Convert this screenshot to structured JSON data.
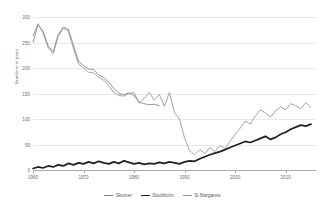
{
  "chart_data": {
    "type": "line",
    "title": "",
    "xlabel": "",
    "ylabel": "Numbers of pairs",
    "xlim": [
      1960,
      2016
    ],
    "ylim": [
      0,
      300
    ],
    "yticks": [
      0,
      50,
      100,
      150,
      200,
      250,
      300
    ],
    "xticks": [
      1960,
      1970,
      1980,
      1990,
      2000,
      2010
    ],
    "grid": "horizontal",
    "legend_position": "bottom",
    "colors": {
      "skomer": "#808285",
      "stockholm": "#231f20",
      "st_margarets": "#939598",
      "gridline": "#e9e9ec",
      "axis": "#a7a9ac",
      "text": "#6d6e71"
    },
    "series": [
      {
        "name": "Skomer",
        "color": "#808285",
        "x": [
          1960,
          1961,
          1962,
          1963,
          1964,
          1965,
          1966,
          1967,
          1968,
          1969,
          1970,
          1971,
          1972,
          1973,
          1974,
          1975,
          1976,
          1977,
          1978,
          1979,
          1980,
          1981,
          1982,
          1983,
          1984,
          1985
        ],
        "values": [
          251,
          285,
          272,
          243,
          232,
          266,
          280,
          276,
          245,
          213,
          205,
          198,
          197,
          186,
          181,
          172,
          160,
          150,
          148,
          151,
          146,
          133,
          130,
          128,
          129,
          126
        ]
      },
      {
        "name": "Stockholm",
        "color": "#231f20",
        "x": [
          1960,
          1961,
          1962,
          1963,
          1964,
          1965,
          1966,
          1967,
          1968,
          1969,
          1970,
          1971,
          1972,
          1973,
          1974,
          1975,
          1976,
          1977,
          1978,
          1979,
          1980,
          1981,
          1982,
          1983,
          1984,
          1985,
          1986,
          1987,
          1988,
          1989,
          1990,
          1991,
          1992,
          1993,
          1994,
          1995,
          1996,
          1997,
          1998,
          1999,
          2000,
          2001,
          2002,
          2003,
          2004,
          2005,
          2006,
          2007,
          2008,
          2009,
          2010,
          2011,
          2012,
          2013,
          2014,
          2015
        ],
        "values": [
          3,
          6,
          4,
          8,
          6,
          10,
          8,
          13,
          10,
          14,
          12,
          16,
          13,
          17,
          14,
          12,
          16,
          13,
          18,
          15,
          12,
          14,
          11,
          13,
          12,
          15,
          13,
          16,
          14,
          12,
          16,
          18,
          17,
          22,
          26,
          30,
          33,
          36,
          40,
          44,
          48,
          52,
          56,
          54,
          58,
          62,
          66,
          60,
          64,
          70,
          74,
          80,
          84,
          88,
          86,
          90
        ]
      },
      {
        "name": "St Margarets",
        "color": "#939598",
        "x": [
          1960,
          1961,
          1962,
          1963,
          1964,
          1965,
          1966,
          1967,
          1968,
          1969,
          1970,
          1971,
          1972,
          1973,
          1974,
          1975,
          1976,
          1977,
          1978,
          1979,
          1980,
          1981,
          1982,
          1983,
          1984,
          1985,
          1986,
          1987,
          1988,
          1989,
          1990,
          1991,
          1992,
          1993,
          1994,
          1995,
          1996,
          1997,
          1998,
          1999,
          2000,
          2001,
          2002,
          2003,
          2004,
          2005,
          2006,
          2007,
          2008,
          2009,
          2010,
          2011,
          2012,
          2013,
          2014,
          2015
        ],
        "values": [
          263,
          287,
          268,
          240,
          228,
          262,
          278,
          272,
          238,
          208,
          200,
          192,
          190,
          182,
          176,
          165,
          152,
          146,
          145,
          150,
          152,
          131,
          140,
          152,
          137,
          148,
          125,
          152,
          112,
          100,
          62,
          38,
          30,
          40,
          32,
          44,
          36,
          48,
          42,
          56,
          70,
          82,
          96,
          90,
          106,
          118,
          112,
          104,
          116,
          124,
          118,
          130,
          126,
          120,
          132,
          122
        ]
      }
    ]
  },
  "legend": {
    "items": [
      {
        "label": "Skomer",
        "color": "#808285",
        "width": "0.9px"
      },
      {
        "label": "Stockholm",
        "color": "#231f20",
        "width": "1.6px"
      },
      {
        "label": "St Margarets",
        "color": "#939598",
        "width": "0.9px"
      }
    ]
  }
}
